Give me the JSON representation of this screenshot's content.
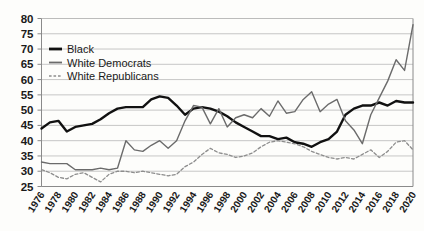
{
  "chart_data": {
    "type": "line",
    "title": "",
    "subtitle": "",
    "xlabel": "",
    "ylabel": "",
    "xlim": [
      1976,
      2020
    ],
    "ylim": [
      25,
      80
    ],
    "ytick_step": 5,
    "xtick_step": 2,
    "grid": true,
    "legend_position": "top-left",
    "yticks": [
      25,
      30,
      35,
      40,
      45,
      50,
      55,
      60,
      65,
      70,
      75,
      80
    ],
    "x": [
      1976,
      1977,
      1978,
      1979,
      1980,
      1981,
      1982,
      1983,
      1984,
      1985,
      1986,
      1987,
      1988,
      1989,
      1990,
      1991,
      1992,
      1993,
      1994,
      1995,
      1996,
      1997,
      1998,
      1999,
      2000,
      2001,
      2002,
      2003,
      2004,
      2005,
      2006,
      2007,
      2008,
      2009,
      2010,
      2011,
      2012,
      2013,
      2014,
      2015,
      2016,
      2017,
      2018,
      2019,
      2020
    ],
    "xtick_labels": [
      "1976",
      "1978",
      "1980",
      "1982",
      "1984",
      "1986",
      "1988",
      "1990",
      "1992",
      "1994",
      "1996",
      "1998",
      "2000",
      "2002",
      "2004",
      "2006",
      "2008",
      "2010",
      "2012",
      "2014",
      "2016",
      "2018",
      "2020"
    ],
    "series": [
      {
        "name": "Black",
        "color": "#111111",
        "style": "solid",
        "width": 2.4,
        "values": [
          44,
          46,
          46.5,
          43,
          44.5,
          45,
          45.5,
          47,
          49,
          50.5,
          51,
          51,
          51,
          53.5,
          54.5,
          54,
          51.5,
          48.5,
          50.5,
          51,
          50.5,
          49.5,
          48,
          46,
          44.5,
          43,
          41.5,
          41.5,
          40.5,
          41,
          39.5,
          39,
          38,
          39.5,
          40.5,
          43,
          48.5,
          50.5,
          51.5,
          51.5,
          52.5,
          51.5,
          53,
          52.5,
          52.5
        ]
      },
      {
        "name": "White Democrats",
        "color": "#6b6b6b",
        "style": "solid",
        "width": 1.4,
        "values": [
          33,
          32.5,
          32.5,
          32.5,
          30.5,
          30.5,
          30.5,
          31,
          30.5,
          31,
          40,
          37,
          36.5,
          38.5,
          40,
          37.5,
          40,
          46.5,
          51.5,
          51,
          45.5,
          50.5,
          44.5,
          47.5,
          48.5,
          47.5,
          50.5,
          48,
          53,
          49,
          49.5,
          53.5,
          56,
          49.5,
          52,
          53.5,
          46.5,
          43.5,
          39,
          48.5,
          54,
          59.5,
          66.5,
          63,
          78
        ]
      },
      {
        "name": "White Republicans",
        "color": "#8d8d8d",
        "style": "dashed",
        "width": 1.3,
        "values": [
          30.5,
          29.5,
          28,
          27.5,
          29,
          29.5,
          28,
          26.5,
          29,
          30,
          30,
          29.5,
          30,
          29.5,
          29,
          28.5,
          29,
          31.5,
          33,
          35.5,
          37.5,
          36,
          35.5,
          34.5,
          35,
          36,
          38,
          39.5,
          40,
          39.5,
          39,
          38,
          36.5,
          35.5,
          34.5,
          34,
          34.5,
          34,
          35.5,
          37,
          34.5,
          36.5,
          39.5,
          40,
          37
        ]
      }
    ]
  },
  "legend": {
    "items": [
      {
        "label": "Black"
      },
      {
        "label": "White Democrats"
      },
      {
        "label": "White Republicans"
      }
    ]
  }
}
